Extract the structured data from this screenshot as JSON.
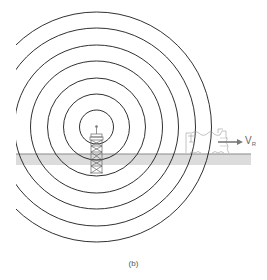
{
  "diagram": {
    "caption": "(b)",
    "velocity_label": {
      "symbol": "V",
      "subscript": "R"
    },
    "colors": {
      "wave_stroke": "#1a1a1a",
      "ground_line": "#8a8a8a",
      "ground_fill": "#dcdcdc",
      "tower_stroke": "#666666",
      "vehicle_stroke": "#9a9a9a",
      "arrow": "#7a7a7a"
    },
    "wave_center": {
      "x": 96.5,
      "y": 127
    },
    "wave_radii": [
      17,
      33,
      49,
      66,
      82,
      99,
      115
    ],
    "elements": [
      "concentric-wavefronts",
      "radio-tower",
      "ground-surface",
      "moving-vehicle",
      "velocity-arrow"
    ]
  }
}
